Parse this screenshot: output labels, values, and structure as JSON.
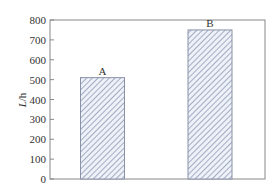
{
  "chart_data": {
    "type": "bar",
    "title": "",
    "xlabel": "",
    "ylabel": "L/h",
    "ylabel_italic": "L",
    "ylabel_rest": "/h",
    "categories": [
      "A",
      "B"
    ],
    "values": [
      510,
      750
    ],
    "ylim": [
      0,
      800
    ],
    "yticks": [
      0,
      100,
      200,
      300,
      400,
      500,
      600,
      700,
      800
    ],
    "grid": false,
    "legend": null,
    "bar_fill": "hatched",
    "hatch_color": "#7a86a8",
    "bar_bg": "#eef1f8",
    "axis_color": "#888888"
  }
}
